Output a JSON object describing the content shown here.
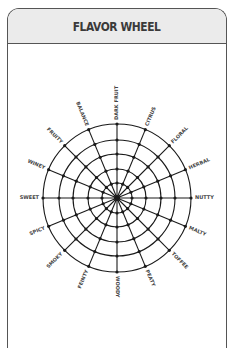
{
  "card": {
    "title": "FLAVOR WHEEL"
  },
  "wheel": {
    "center": [
      117,
      198
    ],
    "ring_radii": [
      15,
      29,
      44,
      58,
      74
    ],
    "spoke_count": 16,
    "line_color": "#1a1a1a",
    "labels": [
      "DARK FRUIT",
      "CITRUS",
      "FLORAL",
      "HERBAL",
      "NUTTY",
      "MALTY",
      "TOFFEE",
      "PEATY",
      "WOODY",
      "FEINTY",
      "SMOKY",
      "SPICY",
      "SWEET",
      "WINEY",
      "FRUITY",
      "BALANCE"
    ]
  },
  "colors": {
    "header_bg": "#ebebeb",
    "border": "#555555",
    "title": "#3a3a3a"
  }
}
